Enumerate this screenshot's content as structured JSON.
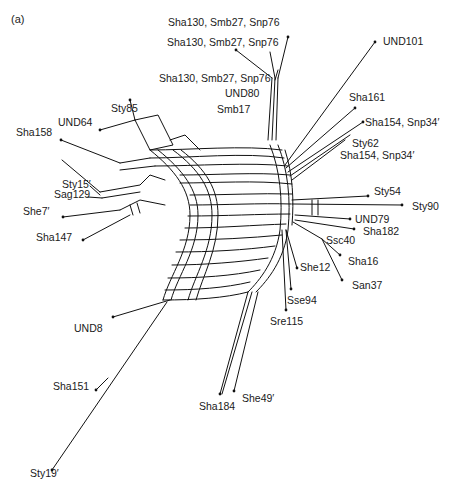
{
  "figure": {
    "panel_label": "(a)",
    "type": "phylogenetic split network",
    "taxa": [
      {
        "id": "t1",
        "label": "Sha130, Smb27, Snp76",
        "x": 168,
        "y": 17
      },
      {
        "id": "t2",
        "label": "UND101",
        "x": 383,
        "y": 36
      },
      {
        "id": "t3",
        "label": "Sha130, Smb27, Snp76",
        "x": 167,
        "y": 37
      },
      {
        "id": "t4",
        "label": "Sha130, Smb27, Snp76",
        "x": 159,
        "y": 73
      },
      {
        "id": "t5",
        "label": "UND80",
        "x": 225,
        "y": 88
      },
      {
        "id": "t6",
        "label": "Smb17",
        "x": 217,
        "y": 104
      },
      {
        "id": "t7",
        "label": "Sty85",
        "x": 111,
        "y": 103
      },
      {
        "id": "t8",
        "label": "UND64",
        "x": 58,
        "y": 117
      },
      {
        "id": "t9",
        "label": "Sha158",
        "x": 16,
        "y": 127
      },
      {
        "id": "t10",
        "label": "Sha161",
        "x": 349,
        "y": 92
      },
      {
        "id": "t11",
        "label": "Sha154, Snp34′",
        "x": 365,
        "y": 117
      },
      {
        "id": "t12",
        "label": "Sty62",
        "x": 352,
        "y": 138
      },
      {
        "id": "t13",
        "label": "Sha154, Snp34′",
        "x": 340,
        "y": 150
      },
      {
        "id": "t14",
        "label": "Sty15′",
        "x": 62,
        "y": 179
      },
      {
        "id": "t15",
        "label": "Sag129",
        "x": 54,
        "y": 189
      },
      {
        "id": "t16",
        "label": "She7′",
        "x": 23,
        "y": 206
      },
      {
        "id": "t17",
        "label": "Sha147",
        "x": 36,
        "y": 232
      },
      {
        "id": "t18",
        "label": "Sty54",
        "x": 374,
        "y": 186
      },
      {
        "id": "t19",
        "label": "Sty90",
        "x": 412,
        "y": 201
      },
      {
        "id": "t20",
        "label": "UND79",
        "x": 355,
        "y": 214
      },
      {
        "id": "t21",
        "label": "Sha182",
        "x": 363,
        "y": 226
      },
      {
        "id": "t22",
        "label": "Ssc40",
        "x": 326,
        "y": 235
      },
      {
        "id": "t23",
        "label": "Sha16",
        "x": 348,
        "y": 256
      },
      {
        "id": "t24",
        "label": "She12",
        "x": 300,
        "y": 262
      },
      {
        "id": "t25",
        "label": "San37",
        "x": 352,
        "y": 280
      },
      {
        "id": "t26",
        "label": "Sse94",
        "x": 287,
        "y": 295
      },
      {
        "id": "t27",
        "label": "Sre115",
        "x": 270,
        "y": 316
      },
      {
        "id": "t28",
        "label": "UND8",
        "x": 74,
        "y": 323
      },
      {
        "id": "t29",
        "label": "Sha151",
        "x": 53,
        "y": 381
      },
      {
        "id": "t30",
        "label": "She49′",
        "x": 242,
        "y": 393
      },
      {
        "id": "t31",
        "label": "Sha184",
        "x": 199,
        "y": 401
      },
      {
        "id": "t32",
        "label": "Sty19′",
        "x": 30,
        "y": 468
      }
    ]
  }
}
